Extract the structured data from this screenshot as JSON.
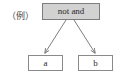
{
  "diagram": {
    "caption": "（例）",
    "root": {
      "label": "not and",
      "fill": "#d2d2d2",
      "border": "#7d7d7d"
    },
    "leaves": [
      {
        "label": "a",
        "fill": "#ffffff",
        "border": "#8a8a8a"
      },
      {
        "label": "b",
        "fill": "#ffffff",
        "border": "#8a8a8a"
      }
    ],
    "edges": [
      {
        "from": "not and",
        "to": "a",
        "style": "arrow"
      },
      {
        "from": "not and",
        "to": "b",
        "style": "arrow"
      }
    ],
    "background": "#ffffff",
    "edge_color": "#6e6e6e"
  }
}
